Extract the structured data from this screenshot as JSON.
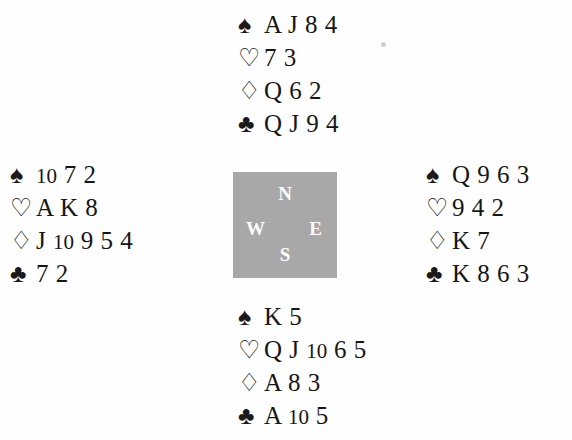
{
  "diagram": {
    "type": "bridge-deal",
    "suit_symbols": {
      "spade": "♠",
      "heart": "♡",
      "diamond": "♢",
      "club": "♣"
    },
    "compass": {
      "north": "N",
      "south": "S",
      "west": "W",
      "east": "E",
      "background_color": "#a8a8a8",
      "letter_color": "#fbfbfb"
    },
    "hands": {
      "north": {
        "label": "North",
        "spades": "A J 8 4",
        "hearts": "7 3",
        "diamonds": "Q 6 2",
        "clubs": "Q J 9 4"
      },
      "west": {
        "label": "West",
        "spades": "10 7 2",
        "hearts": "A K 8",
        "diamonds": "J 10 9 5 4",
        "clubs": "7 2"
      },
      "east": {
        "label": "East",
        "spades": "Q 9 6 3",
        "hearts": "9 4 2",
        "diamonds": "K 7",
        "clubs": "K 8 6 3"
      },
      "south": {
        "label": "South",
        "spades": "K 5",
        "hearts": "Q J 10 6 5",
        "diamonds": "A 8 3",
        "clubs": "A 10 5"
      }
    }
  }
}
